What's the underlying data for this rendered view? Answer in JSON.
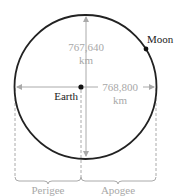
{
  "diagram": {
    "labels": {
      "moon": "Moon",
      "earth": "Earth",
      "vertical_value": "767,640",
      "vertical_unit": "km",
      "horizontal_value": "768,800",
      "horizontal_unit": "km",
      "perigee": "Perigee",
      "apogee": "Apogee"
    },
    "colors": {
      "orbit": "#222222",
      "measure": "#aaaaaa",
      "dark_text": "#222222",
      "gray_text": "#a8a8a8"
    }
  }
}
